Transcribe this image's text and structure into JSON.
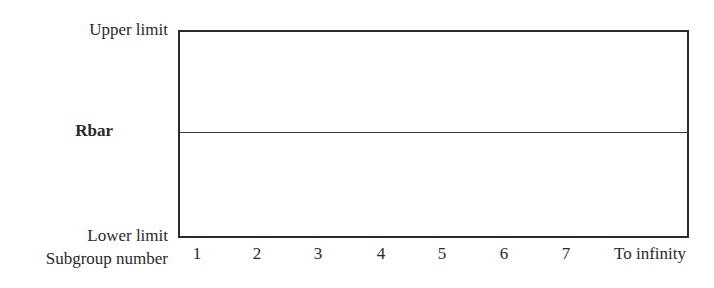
{
  "diagram": {
    "type": "control-chart-template",
    "y_labels": {
      "upper": "Upper limit",
      "center": "Rbar",
      "lower": "Lower limit"
    },
    "x_axis": {
      "title": "Subgroup number",
      "ticks": [
        "1",
        "2",
        "3",
        "4",
        "5",
        "6",
        "7",
        "To infinity"
      ]
    },
    "colors": {
      "line": "#2b2b2b",
      "text": "#2a2a2a",
      "background": "#ffffff"
    }
  }
}
